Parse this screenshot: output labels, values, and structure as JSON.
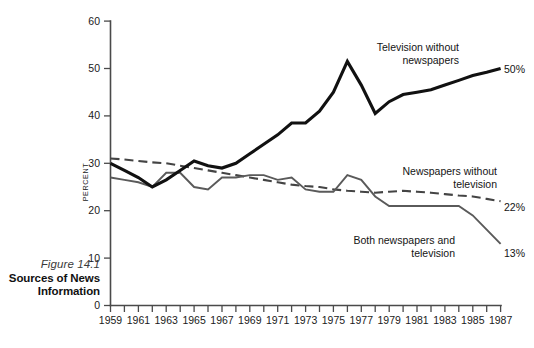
{
  "figure": {
    "number_label": "Figure 14.1",
    "title_line_1": "Sources of News",
    "title_line_2": "Information"
  },
  "axes": {
    "y_label": "PERCENT",
    "y_ticks": [
      "0",
      "10",
      "20",
      "30",
      "40",
      "50",
      "60"
    ],
    "x_ticks": [
      "1959",
      "1961",
      "1963",
      "1965",
      "1967",
      "1969",
      "1971",
      "1973",
      "1975",
      "1977",
      "1979",
      "1981",
      "1983",
      "1985",
      "1987"
    ]
  },
  "annotations": {
    "television_label_line_1": "Television without",
    "television_label_line_2": "newspapers",
    "newspapers_label_line_1": "Newspapers without",
    "newspapers_label_line_2": "television",
    "both_label_line_1": "Both newspapers and",
    "both_label_line_2": "television",
    "television_end_value": "50%",
    "newspapers_end_value": "22%",
    "both_end_value": "13%"
  },
  "colors": {
    "television_line": "#111111",
    "newspapers_line": "#444444",
    "both_line": "#5a5a5a",
    "axis": "#4a4a4a",
    "background": "#ffffff"
  },
  "chart_data": {
    "type": "line",
    "title": "Sources of News Information",
    "xlabel": "",
    "ylabel": "PERCENT",
    "xlim": [
      1959,
      1987
    ],
    "ylim": [
      0,
      60
    ],
    "grid": false,
    "legend": "annotated-inline",
    "x": [
      1959,
      1960,
      1961,
      1962,
      1963,
      1964,
      1965,
      1966,
      1967,
      1968,
      1969,
      1970,
      1971,
      1972,
      1973,
      1974,
      1975,
      1976,
      1977,
      1978,
      1979,
      1980,
      1981,
      1982,
      1983,
      1984,
      1985,
      1986,
      1987
    ],
    "series": [
      {
        "name": "Television without newspapers",
        "style": "solid-thick",
        "color": "#111111",
        "end_label": "50%",
        "values": [
          30,
          28.5,
          27,
          25,
          26.5,
          28.5,
          30.5,
          29.5,
          29,
          30,
          32,
          34,
          36,
          38.5,
          38.5,
          41,
          45,
          51.5,
          46.5,
          40.5,
          43,
          44.5,
          45,
          45.5,
          46.5,
          47.5,
          48.5,
          49.2,
          50
        ]
      },
      {
        "name": "Newspapers without television",
        "style": "dashed",
        "color": "#444444",
        "end_label": "22%",
        "values": [
          31,
          30.8,
          30.5,
          30.2,
          30,
          29.5,
          29,
          28.5,
          28,
          27.5,
          27,
          26.5,
          26,
          25.5,
          25.2,
          25,
          24.5,
          24.2,
          24,
          23.8,
          24,
          24.2,
          24,
          23.8,
          23.5,
          23.2,
          23,
          22.5,
          22
        ]
      },
      {
        "name": "Both newspapers and television",
        "style": "solid-thin",
        "color": "#5a5a5a",
        "end_label": "13%",
        "values": [
          27,
          26.5,
          26,
          25,
          28,
          28,
          25,
          24.5,
          27,
          27,
          27.5,
          27.5,
          26.5,
          27,
          24.5,
          24,
          24,
          27.5,
          26.5,
          23,
          21,
          21,
          21,
          21,
          21,
          21,
          19,
          16,
          13
        ]
      }
    ]
  }
}
